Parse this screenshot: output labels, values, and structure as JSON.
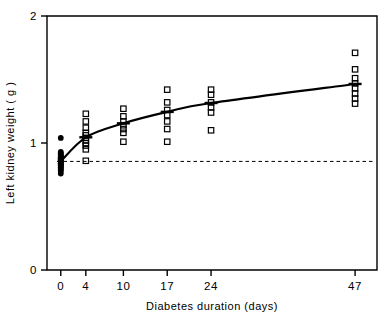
{
  "chart_data": {
    "type": "scatter",
    "title": "",
    "xlabel": "Diabetes duration (days)",
    "ylabel": "Left kidney weight ( g )",
    "xticks": [
      0,
      4,
      10,
      17,
      24,
      47
    ],
    "xtick_labels": [
      "0",
      "4",
      "10",
      "17",
      "24",
      "47"
    ],
    "yticks": [
      0,
      1,
      2
    ],
    "ytick_labels": [
      "0",
      "1",
      "2"
    ],
    "xlim": [
      -2.2,
      50.5
    ],
    "ylim": [
      0,
      2
    ],
    "grid": false,
    "legend": null,
    "reference_line": {
      "style": "dashed",
      "y": 0.855,
      "label": "control mean"
    },
    "series": [
      {
        "name": "Control (day 0)",
        "marker": "filled-circle",
        "x": [
          0,
          0,
          0,
          0,
          0,
          0,
          0,
          0,
          0,
          0,
          0,
          0,
          0,
          0,
          0,
          0,
          0,
          0,
          0,
          0,
          0,
          0,
          0,
          0,
          0
        ],
        "y": [
          1.04,
          0.93,
          0.92,
          0.91,
          0.9,
          0.89,
          0.89,
          0.88,
          0.88,
          0.87,
          0.87,
          0.86,
          0.86,
          0.85,
          0.85,
          0.84,
          0.84,
          0.83,
          0.82,
          0.82,
          0.81,
          0.8,
          0.79,
          0.78,
          0.76
        ]
      },
      {
        "name": "Diabetic (day 4)",
        "marker": "open-square",
        "x": [
          4,
          4,
          4,
          4,
          4,
          4,
          4,
          4,
          4,
          4,
          4
        ],
        "y": [
          1.23,
          1.17,
          1.12,
          1.08,
          1.06,
          1.04,
          1.02,
          1.0,
          0.98,
          0.95,
          0.86
        ]
      },
      {
        "name": "Diabetic (day 10)",
        "marker": "open-square",
        "x": [
          10,
          10,
          10,
          10,
          10,
          10,
          10
        ],
        "y": [
          1.27,
          1.21,
          1.17,
          1.14,
          1.11,
          1.08,
          1.01
        ]
      },
      {
        "name": "Diabetic (day 17)",
        "marker": "open-square",
        "x": [
          17,
          17,
          17,
          17,
          17,
          17,
          17
        ],
        "y": [
          1.42,
          1.32,
          1.26,
          1.22,
          1.17,
          1.11,
          1.01
        ]
      },
      {
        "name": "Diabetic (day 24)",
        "marker": "open-square",
        "x": [
          24,
          24,
          24,
          24,
          24,
          24
        ],
        "y": [
          1.42,
          1.38,
          1.32,
          1.28,
          1.24,
          1.1
        ]
      },
      {
        "name": "Diabetic (day 47)",
        "marker": "open-square",
        "x": [
          47,
          47,
          47,
          47,
          47,
          47,
          47,
          47
        ],
        "y": [
          1.71,
          1.58,
          1.51,
          1.47,
          1.43,
          1.39,
          1.35,
          1.31
        ]
      }
    ],
    "mean_line": {
      "name": "Group mean",
      "style": "solid",
      "x": [
        0,
        4,
        10,
        17,
        24,
        47
      ],
      "y": [
        0.855,
        1.045,
        1.155,
        1.245,
        1.315,
        1.465
      ]
    },
    "mean_markers": {
      "style": "horizontal-bar",
      "x": [
        4,
        10,
        17,
        24,
        47
      ],
      "y": [
        1.045,
        1.155,
        1.245,
        1.315,
        1.465
      ]
    }
  }
}
